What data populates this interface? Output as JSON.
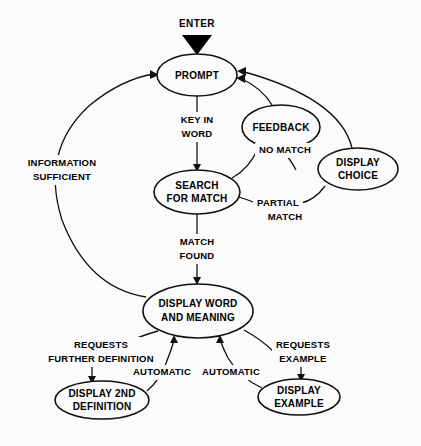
{
  "diagram": {
    "title": "ENTER",
    "background_color": "#fbfbfb",
    "line_color": "#111111",
    "text_color": "#000000"
  },
  "entry": {
    "label": "ENTER",
    "marker": "solid-down-triangle"
  },
  "nodes": [
    {
      "id": "prompt",
      "label_line1": "PROMPT",
      "label_line2": "",
      "cx": 197,
      "cy": 75,
      "rx": 40,
      "ry": 21
    },
    {
      "id": "feedback",
      "label_line1": "FEEDBACK",
      "label_line2": "",
      "cx": 281,
      "cy": 127,
      "rx": 39,
      "ry": 22
    },
    {
      "id": "display_choice",
      "label_line1": "DISPLAY",
      "label_line2": "CHOICE",
      "cx": 358,
      "cy": 169,
      "rx": 40,
      "ry": 21
    },
    {
      "id": "search",
      "label_line1": "SEARCH",
      "label_line2": "FOR MATCH",
      "cx": 197,
      "cy": 192,
      "rx": 43,
      "ry": 22
    },
    {
      "id": "display_word",
      "label_line1": "DISPLAY WORD",
      "label_line2": "AND MEANING",
      "cx": 198,
      "cy": 311,
      "rx": 55,
      "ry": 27
    },
    {
      "id": "display_2nd",
      "label_line1": "DISPLAY 2ND",
      "label_line2": "DEFINITION",
      "cx": 102,
      "cy": 400,
      "rx": 47,
      "ry": 19
    },
    {
      "id": "display_example",
      "label_line1": "DISPLAY",
      "label_line2": "EXAMPLE",
      "cx": 299,
      "cy": 397,
      "rx": 41,
      "ry": 18
    }
  ],
  "edges": [
    {
      "id": "enter-prompt",
      "label_line1": "",
      "label_line2": "",
      "from": "entry",
      "to": "prompt"
    },
    {
      "id": "prompt-search",
      "label_line1": "KEY IN",
      "label_line2": "WORD",
      "from": "prompt",
      "to": "search"
    },
    {
      "id": "search-feedback",
      "label_line1": "NO MATCH",
      "label_line2": "",
      "from": "search",
      "to": "feedback"
    },
    {
      "id": "search-display-choice",
      "label_line1": "PARTIAL",
      "label_line2": "MATCH",
      "from": "search",
      "to": "display_choice"
    },
    {
      "id": "feedback-prompt",
      "label_line1": "",
      "label_line2": "",
      "from": "feedback",
      "to": "prompt"
    },
    {
      "id": "display-choice-prompt",
      "label_line1": "",
      "label_line2": "",
      "from": "display_choice",
      "to": "prompt"
    },
    {
      "id": "search-display-word",
      "label_line1": "MATCH",
      "label_line2": "FOUND",
      "from": "search",
      "to": "display_word"
    },
    {
      "id": "display-word-prompt",
      "label_line1": "INFORMATION",
      "label_line2": "SUFFICIENT",
      "from": "display_word",
      "to": "prompt"
    },
    {
      "id": "display-word-2nd",
      "label_line1": "REQUESTS",
      "label_line2": "FURTHER  DEFINITION",
      "from": "display_word",
      "to": "display_2nd"
    },
    {
      "id": "2nd-display-word",
      "label_line1": "AUTOMATIC",
      "label_line2": "",
      "from": "display_2nd",
      "to": "display_word"
    },
    {
      "id": "display-word-example",
      "label_line1": "REQUESTS",
      "label_line2": "EXAMPLE",
      "from": "display_word",
      "to": "display_example"
    },
    {
      "id": "example-display-word",
      "label_line1": "AUTOMATIC",
      "label_line2": "",
      "from": "display_example",
      "to": "display_word"
    }
  ],
  "labels": {
    "enter": "ENTER",
    "key_in": "KEY IN",
    "word": "WORD",
    "no_match": "NO MATCH",
    "partial": "PARTIAL",
    "match2": "MATCH",
    "match": "MATCH",
    "found": "FOUND",
    "information": "INFORMATION",
    "sufficient": "SUFFICIENT",
    "requests_left": "REQUESTS",
    "further_definition": "FURTHER  DEFINITION",
    "automatic_left": "AUTOMATIC",
    "automatic_right": "AUTOMATIC",
    "requests_right": "REQUESTS",
    "example": "EXAMPLE"
  }
}
